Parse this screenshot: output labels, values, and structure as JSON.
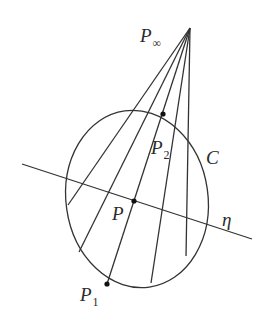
{
  "diagram": {
    "colors": {
      "stroke": "#333333",
      "text": "#2a2a2a",
      "background": "#ffffff"
    },
    "apex": {
      "label": "P",
      "sub": "∞",
      "x": 190,
      "y": 28
    },
    "conic": {
      "label": "C",
      "cx": 137,
      "cy": 199,
      "rx": 71,
      "ry": 89,
      "rotate": -8
    },
    "polar_line": {
      "label": "η",
      "x1": 22,
      "y1": 164,
      "x2": 252,
      "y2": 239
    },
    "rays": [
      {
        "x2": 68,
        "y2": 205
      },
      {
        "x2": 79,
        "y2": 252
      },
      {
        "x2": 107,
        "y2": 284
      },
      {
        "x2": 151,
        "y2": 283
      },
      {
        "x2": 186,
        "y2": 256
      }
    ],
    "points": [
      {
        "name": "P2",
        "label": "P",
        "sub": "2",
        "x": 163,
        "y": 114
      },
      {
        "name": "P",
        "label": "P",
        "sub": "",
        "x": 134,
        "y": 201
      },
      {
        "name": "P1",
        "label": "P",
        "sub": "1",
        "x": 107,
        "y": 284
      }
    ]
  },
  "labels": {
    "p_inf": "P",
    "p_inf_sub": "∞",
    "p2": "P",
    "p2_sub": "2",
    "c": "C",
    "p": "P",
    "eta": "η",
    "p1": "P",
    "p1_sub": "1"
  }
}
